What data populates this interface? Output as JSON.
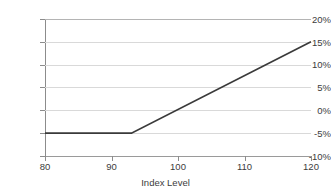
{
  "chart_data": {
    "type": "line",
    "title": "",
    "xlabel": "Index Level",
    "ylabel": "",
    "xlim": [
      80,
      120
    ],
    "ylim": [
      -10,
      20
    ],
    "grid": true,
    "legend": "none",
    "x_ticks": [
      "80",
      "90",
      "100",
      "110",
      "120"
    ],
    "x_tick_values": [
      80,
      90,
      100,
      110,
      120
    ],
    "y_ticks": [
      "20%",
      "15%",
      "10%",
      "5%",
      "0%",
      "-5%",
      "-10%"
    ],
    "y_tick_values": [
      20,
      15,
      10,
      5,
      0,
      -5,
      -10
    ],
    "series": [
      {
        "name": "Payoff",
        "color": "#3a3a3a",
        "x": [
          80,
          93,
          120
        ],
        "values": [
          -5,
          -5,
          15
        ]
      }
    ],
    "annotations": []
  },
  "axis": {
    "x_title": "Index Level"
  },
  "style": {
    "line_color": "#3a3a3a",
    "grid_color": "#d9d9d9",
    "axis_color": "#8c8c8c",
    "text_color": "#3c3c3c",
    "background": "#ffffff"
  }
}
